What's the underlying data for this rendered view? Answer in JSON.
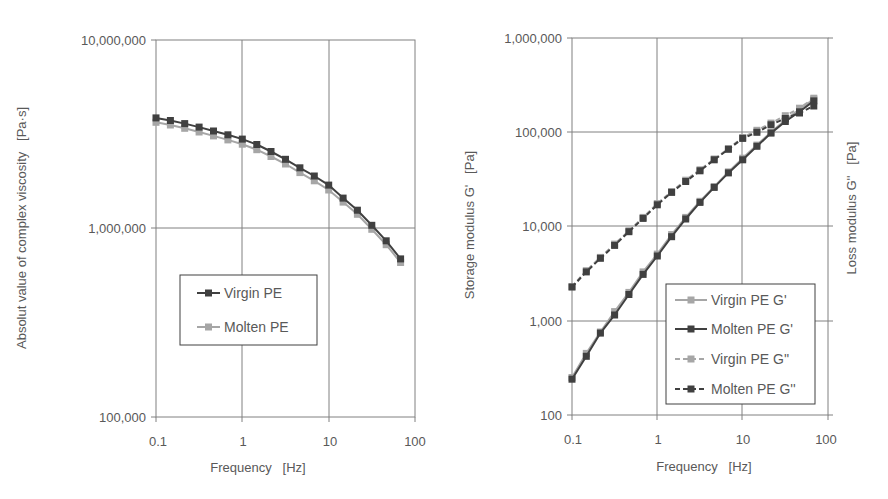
{
  "chart_data": [
    {
      "type": "line",
      "title": "",
      "xlabel": "Frequency   [Hz]",
      "ylabel": "Absolut value of complex viscosity   [Pa·s]",
      "xscale": "log",
      "yscale": "log",
      "xlim": [
        0.1,
        100
      ],
      "ylim": [
        100000,
        10000000
      ],
      "x_ticks": [
        "0.1",
        "1",
        "10",
        "100"
      ],
      "y_ticks": [
        "100,000",
        "1,000,000",
        "10,000,000"
      ],
      "grid": true,
      "legend_position": "inside-left-middle",
      "x": [
        0.1,
        0.147,
        0.215,
        0.316,
        0.464,
        0.681,
        1,
        1.47,
        2.15,
        3.16,
        4.64,
        6.81,
        10,
        14.7,
        21.5,
        31.6,
        46.4,
        68.1
      ],
      "series": [
        {
          "name": "Virgin PE",
          "color": "#404040",
          "marker": "square",
          "linestyle": "solid",
          "values": [
            3860000,
            3740000,
            3600000,
            3450000,
            3290000,
            3140000,
            2980000,
            2790000,
            2560000,
            2330000,
            2100000,
            1900000,
            1700000,
            1450000,
            1250000,
            1040000,
            860000,
            690000
          ]
        },
        {
          "name": "Molten PE",
          "color": "#a6a6a6",
          "marker": "square",
          "linestyle": "solid",
          "values": [
            3660000,
            3540000,
            3400000,
            3250000,
            3100000,
            2950000,
            2800000,
            2620000,
            2410000,
            2200000,
            1980000,
            1790000,
            1600000,
            1380000,
            1190000,
            990000,
            820000,
            660000
          ]
        }
      ]
    },
    {
      "type": "line",
      "title": "",
      "xlabel": "Frequency   [Hz]",
      "ylabel": "Storage modulus G'   [Pa]",
      "ylabel_right": "Loss modulus G''   [Pa]",
      "xscale": "log",
      "yscale": "log",
      "xlim": [
        0.1,
        100
      ],
      "ylim": [
        100,
        1000000
      ],
      "x_ticks": [
        "0.1",
        "1",
        "10",
        "100"
      ],
      "y_ticks": [
        "100",
        "1,000",
        "10,000",
        "100,000",
        "1,000,000"
      ],
      "grid": true,
      "legend_position": "inside-lower-right",
      "x": [
        0.1,
        0.147,
        0.215,
        0.316,
        0.464,
        0.681,
        1,
        1.47,
        2.15,
        3.16,
        4.64,
        6.81,
        10,
        14.7,
        21.5,
        31.6,
        46.4,
        68.1
      ],
      "series": [
        {
          "name": "Virgin PE G'",
          "color": "#a6a6a6",
          "marker": "square",
          "linestyle": "solid",
          "values": [
            250,
            450,
            760,
            1250,
            2000,
            3300,
            5100,
            8200,
            12500,
            18500,
            26500,
            38000,
            53000,
            73000,
            100000,
            135000,
            175000,
            225000
          ]
        },
        {
          "name": "Molten PE G'",
          "color": "#404040",
          "marker": "square",
          "linestyle": "solid",
          "values": [
            240,
            420,
            740,
            1150,
            1900,
            3100,
            4870,
            7800,
            12000,
            18000,
            26000,
            37000,
            51000,
            71000,
            98000,
            130000,
            165000,
            215000
          ]
        },
        {
          "name": "Virgin PE G''",
          "color": "#a6a6a6",
          "marker": "square",
          "linestyle": "dashed",
          "values": [
            2300,
            3400,
            4700,
            6500,
            9000,
            12500,
            17500,
            23500,
            31000,
            40000,
            52000,
            67000,
            88000,
            105000,
            125000,
            150000,
            180000,
            230000
          ]
        },
        {
          "name": "Molten PE G''",
          "color": "#404040",
          "marker": "square",
          "linestyle": "dashed",
          "values": [
            2280,
            3300,
            4600,
            6300,
            8800,
            12200,
            17000,
            23000,
            30000,
            39000,
            51000,
            66000,
            86000,
            100000,
            120000,
            140000,
            160000,
            190000
          ]
        }
      ]
    }
  ],
  "left_chart": {
    "y_ticks": [
      "10,000,000",
      "1,000,000",
      "100,000"
    ],
    "x_ticks": [
      "0.1",
      "1",
      "10",
      "100"
    ],
    "xlabel": "Frequency   [Hz]",
    "ylabel": "Absolut value of complex viscosity   [Pa·s]",
    "legend": [
      "Virgin PE",
      "Molten PE"
    ]
  },
  "right_chart": {
    "y_ticks": [
      "1,000,000",
      "100,000",
      "10,000",
      "1,000",
      "100"
    ],
    "x_ticks": [
      "0.1",
      "1",
      "10",
      "100"
    ],
    "xlabel": "Frequency   [Hz]",
    "ylabel": "Storage modulus G'   [Pa]",
    "ylabel_right": "Loss modulus G''   [Pa]",
    "legend": [
      "Virgin PE G'",
      "Molten PE G'",
      "Virgin PE G''",
      "Molten PE G''"
    ]
  }
}
